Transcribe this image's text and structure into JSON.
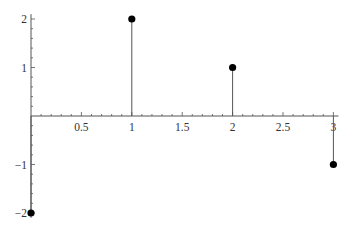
{
  "chart_data": {
    "type": "stem",
    "title": "",
    "xlabel": "",
    "ylabel": "",
    "x": [
      0,
      1,
      2,
      3
    ],
    "series": [
      {
        "name": "data",
        "values": [
          -2,
          2,
          1,
          -1
        ]
      }
    ],
    "xlim": [
      0,
      3.05
    ],
    "ylim": [
      -2.1,
      2.1
    ],
    "x_ticks": [
      0.5,
      1,
      1.5,
      2,
      2.5,
      3
    ],
    "x_tick_labels": [
      "0.5",
      "1",
      "1.5",
      "2",
      "2.5",
      "3"
    ],
    "y_ticks": [
      -2,
      -1,
      1,
      2
    ],
    "y_tick_labels": [
      "−2",
      "−1",
      "1",
      "2"
    ],
    "grid": false,
    "legend": null,
    "colors": {
      "axis": "#555555",
      "stem": "#555555",
      "marker": "#000000",
      "text": "#333333"
    }
  }
}
